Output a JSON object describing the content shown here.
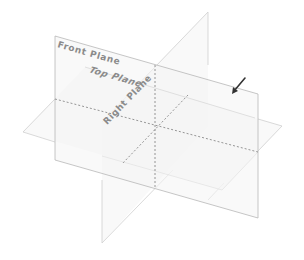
{
  "diagram": {
    "type": "reference-planes-3d",
    "background": "#ffffff",
    "edge_color": "#b8b8b8",
    "hidden_line_color": "#8a8a8a",
    "label_color": "#8a8a8a",
    "arrow_color": "#333333",
    "planes": [
      {
        "id": "front",
        "label": "Front Plane"
      },
      {
        "id": "top",
        "label": "Top Plane"
      },
      {
        "id": "right",
        "label": "Right Plane"
      }
    ],
    "indicator": {
      "icon": "pointer-arrow-icon",
      "points_to": "front"
    }
  }
}
